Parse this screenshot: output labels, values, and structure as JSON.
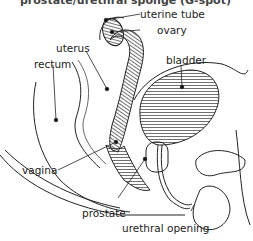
{
  "title": "prostate/urethral sponge (G-spot)",
  "labels": {
    "uterine_tube": "uterine tube",
    "ovary": "ovary",
    "uterus": "uterus",
    "rectum": "rectum",
    "bladder": "bladder",
    "vagina": "vagina",
    "prostate": "prostate",
    "urethral_opening": "urethral opening"
  },
  "colors": {
    "line": "#222222",
    "background": "#ffffff"
  }
}
